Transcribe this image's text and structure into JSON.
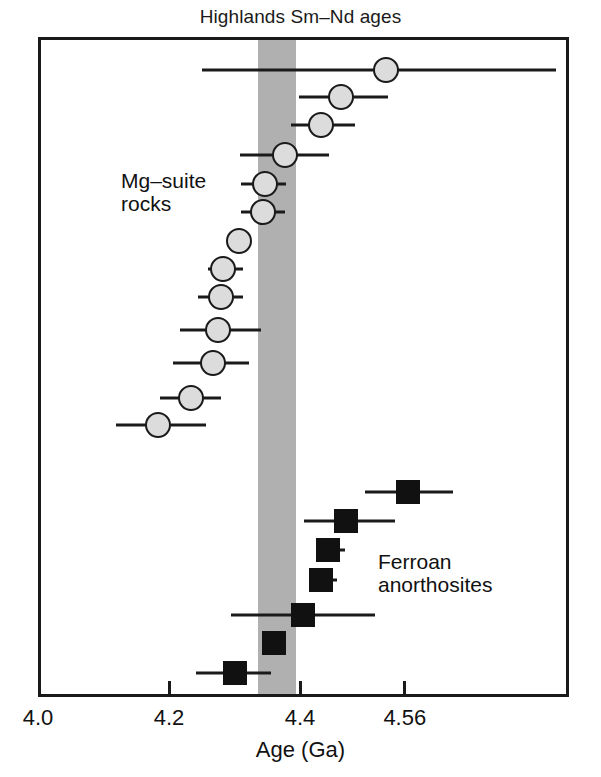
{
  "chart": {
    "title": "Highlands Sm–Nd ages",
    "xlabel": "Age (Ga)",
    "tick_labels": [
      "4.0",
      "4.2",
      "4.4",
      "4.56"
    ],
    "group_label_mg": "Mg–suite\nrocks",
    "group_label_ferroan": "Ferroan\nanorthosites",
    "colors": {
      "band": "#b0b0b0",
      "circle_fill": "#dcdcdc",
      "circle_edge": "#1a1a1a",
      "square_fill": "#111111",
      "frame": "#1a1a1a",
      "background": "#ffffff"
    }
  },
  "chart_data": {
    "type": "scatter",
    "title": "Highlands Sm–Nd ages",
    "xlabel": "Age (Ga)",
    "ylabel": "",
    "xlim": [
      4.0,
      4.81
    ],
    "grid": false,
    "legend": "none",
    "orientation": "horizontal-error-bars",
    "xticks": [
      4.0,
      4.2,
      4.4,
      4.56
    ],
    "xticklabels": [
      "4.0",
      "4.2",
      "4.4",
      "4.56"
    ],
    "annotations": [
      {
        "text": "Mg–suite rocks",
        "x": 4.13,
        "y_row": 5
      },
      {
        "text": "Ferroan anorthosites",
        "x": 4.51,
        "y_row": 17
      }
    ],
    "reference_band": {
      "label": "",
      "x_start": 4.331,
      "x_end": 4.389,
      "color": "#b0b0b0"
    },
    "series": [
      {
        "name": "Mg-suite rocks",
        "marker": "circle",
        "fill": "#dcdcdc",
        "edge": "#1a1a1a",
        "points": [
          {
            "row": 1,
            "x": 4.527,
            "xerr_low": 4.246,
            "xerr_high": 4.786
          },
          {
            "row": 2,
            "x": 4.458,
            "xerr_low": 4.394,
            "xerr_high": 4.53
          },
          {
            "row": 3,
            "x": 4.428,
            "xerr_low": 4.382,
            "xerr_high": 4.48
          },
          {
            "row": 4,
            "x": 4.373,
            "xerr_low": 4.304,
            "xerr_high": 4.44
          },
          {
            "row": 5,
            "x": 4.342,
            "xerr_low": 4.305,
            "xerr_high": 4.374
          },
          {
            "row": 6,
            "x": 4.339,
            "xerr_low": 4.306,
            "xerr_high": 4.372
          },
          {
            "row": 7,
            "x": 4.303,
            "xerr_low": 4.303,
            "xerr_high": 4.303
          },
          {
            "row": 8,
            "x": 4.278,
            "xerr_low": 4.255,
            "xerr_high": 4.308
          },
          {
            "row": 9,
            "x": 4.275,
            "xerr_low": 4.24,
            "xerr_high": 4.308
          },
          {
            "row": 10,
            "x": 4.27,
            "xerr_low": 4.212,
            "xerr_high": 4.336
          },
          {
            "row": 11,
            "x": 4.262,
            "xerr_low": 4.202,
            "xerr_high": 4.318
          },
          {
            "row": 12,
            "x": 4.229,
            "xerr_low": 4.182,
            "xerr_high": 4.275
          },
          {
            "row": 13,
            "x": 4.178,
            "xerr_low": 4.114,
            "xerr_high": 4.252
          }
        ]
      },
      {
        "name": "Ferroan anorthosites",
        "marker": "square",
        "fill": "#111111",
        "edge": "#111111",
        "points": [
          {
            "row": 14,
            "x": 4.56,
            "xerr_low": 4.494,
            "xerr_high": 4.629
          },
          {
            "row": 15,
            "x": 4.466,
            "xerr_low": 4.401,
            "xerr_high": 4.541
          },
          {
            "row": 16,
            "x": 4.438,
            "xerr_low": 4.42,
            "xerr_high": 4.464
          },
          {
            "row": 17,
            "x": 4.427,
            "xerr_low": 4.409,
            "xerr_high": 4.452
          },
          {
            "row": 18,
            "x": 4.4,
            "xerr_low": 4.29,
            "xerr_high": 4.51
          },
          {
            "row": 19,
            "x": 4.355,
            "xerr_low": 4.355,
            "xerr_high": 4.355
          },
          {
            "row": 20,
            "x": 4.296,
            "xerr_low": 4.236,
            "xerr_high": 4.351
          }
        ]
      }
    ],
    "row_y_px": {
      "1": 67,
      "2": 94,
      "3": 122,
      "4": 152,
      "5": 181,
      "6": 209,
      "7": 238,
      "8": 266,
      "9": 294,
      "10": 327,
      "11": 360,
      "12": 395,
      "13": 422,
      "14": 489,
      "15": 518,
      "16": 547,
      "17": 577,
      "18": 612,
      "19": 640,
      "20": 670
    }
  }
}
